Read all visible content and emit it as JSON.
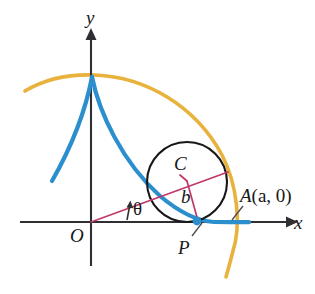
{
  "figure": {
    "width": 315,
    "height": 294,
    "background": "#ffffff"
  },
  "colors": {
    "axis": "#2e2e33",
    "curve_blue": "#2b8fce",
    "curve_yellow": "#e8b23c",
    "circle_black": "#17171a",
    "radius_magenta": "#c0396b",
    "leader_gray": "#4a4a50",
    "text": "#17171a"
  },
  "axes": {
    "origin": {
      "x": 91,
      "y": 222
    },
    "x_axis": {
      "label": "x",
      "from": {
        "x": 20,
        "y": 222
      },
      "to": {
        "x": 290,
        "y": 222
      },
      "arrow": "right"
    },
    "y_axis": {
      "label": "y",
      "from": {
        "x": 91,
        "y": 265
      },
      "to": {
        "x": 91,
        "y": 34
      },
      "arrow": "up"
    }
  },
  "labels": {
    "origin": "O",
    "x_axis": "x",
    "y_axis": "y",
    "center": "C",
    "offset": "b",
    "point": "P",
    "angle": "θ",
    "point_a_name": "A",
    "point_a_coords": "(a, 0)",
    "point_a_full": "A(a, 0)"
  },
  "circle": {
    "name": "rolling-circle",
    "center": {
      "x": 187,
      "y": 182
    },
    "radius": 40,
    "tangent_point": {
      "x": 187,
      "y": 222
    },
    "stroke": "#17171a",
    "stroke_width": 2.1
  },
  "points": {
    "C": {
      "x": 187,
      "y": 182,
      "label": "C",
      "description": "center of rolling circle"
    },
    "P": {
      "x": 197,
      "y": 221,
      "label": "P",
      "description": "tracing point on blue trochoid"
    },
    "A": {
      "x": 233,
      "y": 222,
      "label": "A(a, 0)",
      "description": "point on x-axis where yellow arc crosses"
    },
    "O": {
      "x": 91,
      "y": 222,
      "label": "O",
      "description": "origin"
    }
  },
  "segments": {
    "ray_OC": {
      "name": "ray-from-origin-through-circle",
      "from": {
        "x": 91,
        "y": 222
      },
      "to": {
        "x": 228,
        "y": 172
      },
      "color": "#c0396b",
      "width": 1.6
    },
    "radius_CP": {
      "name": "radius-center-to-P",
      "from": {
        "x": 187,
        "y": 182
      },
      "to": {
        "x": 197,
        "y": 221
      },
      "color": "#c0396b",
      "width": 1.6,
      "length_label": "b"
    },
    "chord_in_circle": {
      "name": "chord-through-center",
      "from": {
        "x": 152,
        "y": 195
      },
      "to": {
        "x": 228,
        "y": 172
      },
      "color": "#c0396b",
      "width": 1.6
    },
    "angle_arrow": {
      "name": "theta-angle-indicator",
      "from": {
        "x": 128,
        "y": 219
      },
      "to": {
        "x": 131,
        "y": 203
      },
      "color": "#2e2e33"
    },
    "leader_P": {
      "from": {
        "x": 192,
        "y": 237
      },
      "to": {
        "x": 201,
        "y": 224
      },
      "color": "#4a4a50"
    },
    "leader_A": {
      "from": {
        "x": 243,
        "y": 206
      },
      "to": {
        "x": 232,
        "y": 220
      },
      "color": "#4a4a50"
    }
  },
  "curves": {
    "blue_trochoid": {
      "name": "blue-trochoid-curve",
      "color": "#2b8fce",
      "width": 4.2,
      "cusp": {
        "x": 92,
        "y": 77
      },
      "description": "curve with cusp on y-axis, left branch descending to lower-left, right branch descending through circle to point P and onward to the right along the x-axis",
      "left_branch": "M 92 77 C 86 104, 74 140, 52 181",
      "right_branch": "M 92 77 C 98 110, 120 160, 160 196 C 180 213, 196 221, 215 222 C 228 222, 240 222, 248 222"
    },
    "yellow_arc": {
      "name": "yellow-outer-arc",
      "color": "#e8b23c",
      "width": 3.6,
      "description": "large circular arc passing over the cusp and down past point A to the lower right",
      "path": "M 25 91 C 45 79, 70 74, 95 75 C 145 77, 195 105, 222 155 C 238 186, 240 225, 233 250 C 230 262, 228 270, 226 276"
    }
  },
  "interactive": {
    "is_static_figure": true
  }
}
